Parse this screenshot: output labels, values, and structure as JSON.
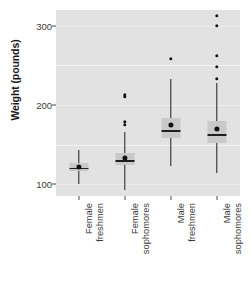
{
  "chart_data": {
    "type": "boxplot",
    "title": "",
    "xlabel": "",
    "ylabel": "Weight (pounds)",
    "ylim": [
      85,
      320
    ],
    "yticks": [
      100,
      200,
      300
    ],
    "ytick_labels": [
      "100",
      "200",
      "300"
    ],
    "grid": true,
    "grid_major_values": [
      150,
      250
    ],
    "grid_minor_values": [
      100,
      200,
      300
    ],
    "legend": "none",
    "panel_background": "#e2e2e2",
    "marker_color": "#111111",
    "box_fill": "#c9c9c9",
    "line_color": "#1f1f1f",
    "categories": [
      "Female freshmen",
      "Female sophomores",
      "Male freshmen",
      "Male sophomores"
    ],
    "category_lines": [
      [
        "Female",
        "freshmen"
      ],
      [
        "Female",
        "sophomores"
      ],
      [
        "Male",
        "freshmen"
      ],
      [
        "Male",
        "sophomores"
      ]
    ],
    "series": [
      {
        "name": "Female freshmen",
        "whisker_low": 100,
        "q1": 116,
        "median": 121,
        "q3": 127,
        "whisker_high": 143,
        "mean": 122,
        "outliers": []
      },
      {
        "name": "Female sophomores",
        "whisker_low": 93,
        "q1": 124,
        "median": 130,
        "q3": 139,
        "whisker_high": 166,
        "mean": 133,
        "outliers": [
          213,
          210,
          179,
          175
        ]
      },
      {
        "name": "Male freshmen",
        "whisker_low": 123,
        "q1": 158,
        "median": 168,
        "q3": 183,
        "whisker_high": 233,
        "mean": 175,
        "outliers": [
          258
        ]
      },
      {
        "name": "Male sophomores",
        "whisker_low": 114,
        "q1": 152,
        "median": 163,
        "q3": 180,
        "whisker_high": 228,
        "mean": 170,
        "outliers": [
          313,
          300,
          262,
          248,
          233
        ]
      }
    ]
  }
}
